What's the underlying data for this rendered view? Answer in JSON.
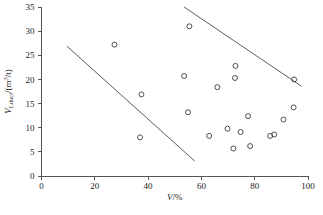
{
  "chart_data": {
    "type": "scatter",
    "title": "",
    "xlabel": "V/%",
    "ylabel": "V_Lduct/(m^3/t)",
    "xlabel_parts": {
      "symbol": "V",
      "slash": "/",
      "unit": "%"
    },
    "ylabel_parts": {
      "symbol": "V",
      "subscript": "Lduct",
      "slash": "/(m",
      "superscript": "3",
      "tail": "/t)"
    },
    "xlim": [
      0,
      100
    ],
    "ylim": [
      0,
      35
    ],
    "xticks": [
      "0",
      "20",
      "40",
      "60",
      "80",
      "100"
    ],
    "yticks": [
      "0",
      "5",
      "10",
      "15",
      "20",
      "25",
      "30",
      "35"
    ],
    "grid": "off",
    "legend": "none",
    "marker": "open-circle",
    "points": [
      {
        "x": 27.4,
        "y": 27.2
      },
      {
        "x": 37.0,
        "y": 8.0
      },
      {
        "x": 37.5,
        "y": 16.9
      },
      {
        "x": 53.5,
        "y": 20.7
      },
      {
        "x": 55.5,
        "y": 31.0
      },
      {
        "x": 55.0,
        "y": 13.2
      },
      {
        "x": 62.9,
        "y": 8.3
      },
      {
        "x": 66.0,
        "y": 18.4
      },
      {
        "x": 69.8,
        "y": 9.8
      },
      {
        "x": 72.0,
        "y": 5.7
      },
      {
        "x": 72.6,
        "y": 20.3
      },
      {
        "x": 72.8,
        "y": 22.8
      },
      {
        "x": 74.7,
        "y": 9.1
      },
      {
        "x": 77.5,
        "y": 12.4
      },
      {
        "x": 78.3,
        "y": 6.2
      },
      {
        "x": 85.8,
        "y": 8.3
      },
      {
        "x": 87.3,
        "y": 8.6
      },
      {
        "x": 90.8,
        "y": 11.7
      },
      {
        "x": 94.6,
        "y": 14.2
      },
      {
        "x": 94.8,
        "y": 20.0
      }
    ],
    "trend_lines": [
      {
        "name": "upper-envelope-left",
        "x1": 9.5,
        "y1": 26.9,
        "x2": 57.5,
        "y2": 3.1
      },
      {
        "name": "upper-envelope-right",
        "x1": 53.5,
        "y1": 35.0,
        "x2": 97.5,
        "y2": 18.6
      }
    ],
    "colors": {
      "axis": "#555555",
      "marker_stroke": "#3c3c3c",
      "trend": "#4a4a4a",
      "text": "#1a1a1a",
      "background": "#ffffff"
    }
  }
}
